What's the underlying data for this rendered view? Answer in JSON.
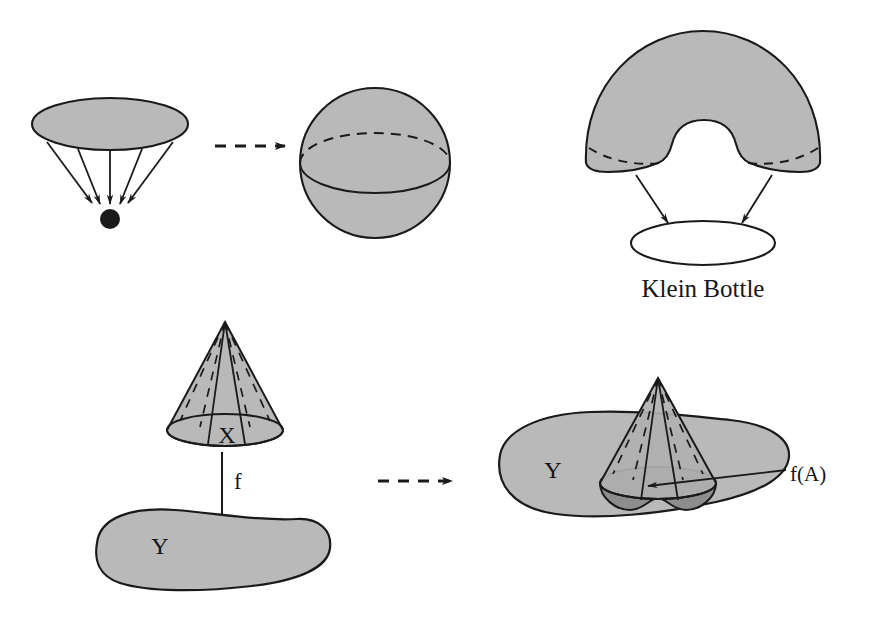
{
  "figure": {
    "title": "",
    "background_color": "#ffffff",
    "stroke_color": "#1a1a1a",
    "fill_light_gray": "#b8b8b8",
    "fill_mid_gray": "#9a9a9a",
    "fill_dark_gray": "#8a8a8a",
    "fill_white": "#ffffff"
  },
  "panels": {
    "top_left": {
      "name": "disk-collapses-to-point",
      "shapes": [
        "filled-ellipse-disk",
        "five-converging-arrows",
        "black-point"
      ],
      "arrow_count": 5
    },
    "top_middle": {
      "name": "sphere",
      "shapes": [
        "shaded-sphere",
        "equator-solid-front-arc",
        "equator-dashed-back-arc"
      ]
    },
    "top_right": {
      "name": "klein-bottle-construction",
      "label": "Klein Bottle",
      "shapes": [
        "shaded-dome-with-notch",
        "dashed-rim-arcs",
        "two-arrows",
        "open-ellipse"
      ],
      "arrow_count": 2
    },
    "bottom_left": {
      "name": "cone-maps-to-blob",
      "cone_label": "X",
      "map_label": "f",
      "target_label": "Y",
      "shapes": [
        "shaded-cone",
        "dashed-ruling-lines",
        "down-arrow",
        "shaded-blob"
      ]
    },
    "bottom_right": {
      "name": "image-of-cone-in-blob",
      "target_label": "Y",
      "image_label": "f(A)",
      "shapes": [
        "shaded-blob",
        "shaded-cone-overlay",
        "dark-image-region",
        "leader-line-arrow"
      ]
    }
  },
  "transitions": [
    {
      "name": "arrow-top",
      "style": "dashed",
      "label": ""
    },
    {
      "name": "arrow-bottom",
      "style": "dashed",
      "label": ""
    }
  ],
  "labels": {
    "klein_bottle": "Klein Bottle",
    "x": "X",
    "f": "f",
    "y_left": "Y",
    "y_right": "Y",
    "fa": "f(A)"
  }
}
